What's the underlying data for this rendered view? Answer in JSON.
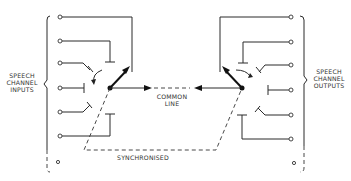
{
  "diagram": {
    "type": "TDM synchronised rotary switch schematic",
    "labels": {
      "inputs": [
        "SPEECH",
        "CHANNEL",
        "INPUTS"
      ],
      "outputs": [
        "SPEECH",
        "CHANNEL",
        "OUTPUTS"
      ],
      "common_line": [
        "COMMON",
        "LINE"
      ],
      "synchronised": "SYNCHRONISED"
    },
    "input_channel_count": 7,
    "output_channel_count": 7,
    "colors": {
      "ink": "#222222",
      "background": "#ffffff"
    }
  }
}
